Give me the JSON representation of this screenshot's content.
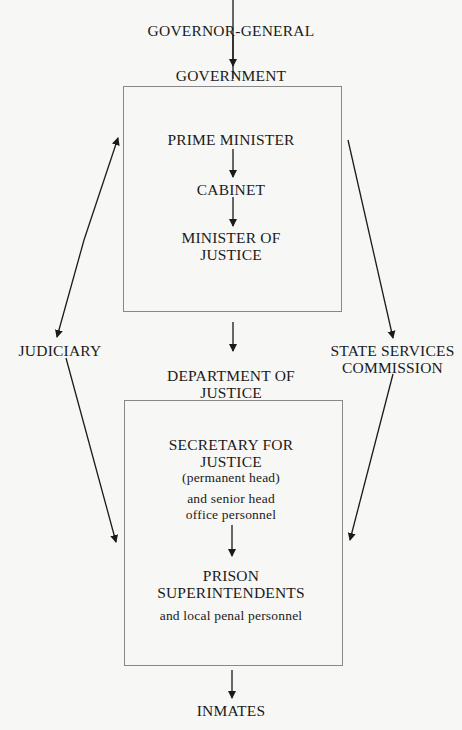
{
  "diagram": {
    "nodes": {
      "governor_general": "GOVERNOR-GENERAL",
      "government": "GOVERNMENT",
      "prime_minister": "PRIME MINISTER",
      "cabinet": "CABINET",
      "minister_line1": "MINISTER OF",
      "minister_line2": "JUSTICE",
      "judiciary": "JUDICIARY",
      "ssc_line1": "STATE SERVICES",
      "ssc_line2": "COMMISSION",
      "dept_line1": "DEPARTMENT OF",
      "dept_line2": "JUSTICE",
      "secretary_line1": "SECRETARY FOR",
      "secretary_line2": "JUSTICE",
      "secretary_note": "(permanent head)",
      "senior_line1": "and senior head",
      "senior_line2": "office personnel",
      "prison_line1": "PRISON",
      "prison_line2": "SUPERINTENDENTS",
      "local_personnel": "and local penal personnel",
      "inmates": "INMATES"
    },
    "edges": [
      {
        "from": "GOVERNOR-GENERAL",
        "to": "GOVERNMENT"
      },
      {
        "from": "PRIME MINISTER",
        "to": "CABINET"
      },
      {
        "from": "CABINET",
        "to": "MINISTER OF JUSTICE"
      },
      {
        "from": "GOVERNMENT",
        "to": "DEPARTMENT OF JUSTICE"
      },
      {
        "from": "GOVERNMENT",
        "to": "JUDICIARY",
        "bidirectional": true
      },
      {
        "from": "GOVERNMENT",
        "to": "STATE SERVICES COMMISSION"
      },
      {
        "from": "JUDICIARY",
        "to": "PRISON SUPERINTENDENTS"
      },
      {
        "from": "STATE SERVICES COMMISSION",
        "to": "PRISON SUPERINTENDENTS"
      },
      {
        "from": "SECRETARY FOR JUSTICE",
        "to": "PRISON SUPERINTENDENTS"
      },
      {
        "from": "PRISON SUPERINTENDENTS",
        "to": "INMATES"
      }
    ],
    "colors": {
      "ink": "#1a1a1a",
      "box_border": "#888888",
      "background": "#f7f7f5"
    }
  }
}
